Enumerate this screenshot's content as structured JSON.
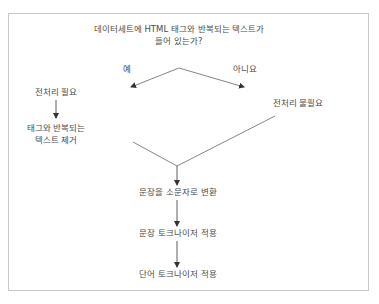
{
  "diagram": {
    "type": "flowchart",
    "question": {
      "line1": "데이터세트에 HTML 태그와 반복되는 텍스트가",
      "line2": "들어 있는가?"
    },
    "branches": {
      "yes": "예",
      "no": "아니요"
    },
    "yes_path": {
      "step1": "전처리 필요",
      "step2_line1": "태그와 반복되는",
      "step2_line2": "텍스트 제거"
    },
    "no_path": {
      "step1": "전처리 불필요"
    },
    "common_steps": [
      "문장을 소문자로 변환",
      "문장 토크나이저 적용",
      "단어 토크나이저 적용"
    ],
    "colors": {
      "line": "#555555",
      "text": "#4a4a4a",
      "border": "#c8c8c8"
    }
  }
}
